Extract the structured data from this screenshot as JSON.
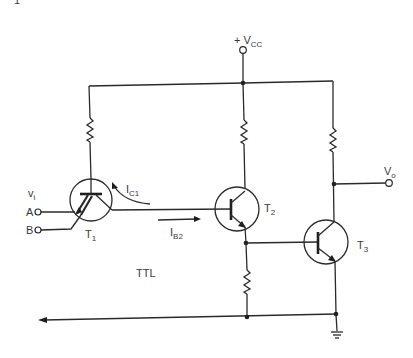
{
  "diagram": {
    "title": "TTL",
    "supply": {
      "label": "+ V",
      "subscript": "CC"
    },
    "output": {
      "label": "V",
      "subscript": "o"
    },
    "input": {
      "label": "v",
      "subscript": "i",
      "pins": [
        "A",
        "B"
      ]
    },
    "transistors": [
      {
        "label": "T",
        "subscript": "1",
        "type": "multi-emitter npn"
      },
      {
        "label": "T",
        "subscript": "2",
        "type": "npn"
      },
      {
        "label": "T",
        "subscript": "3",
        "type": "npn"
      }
    ],
    "currents": [
      {
        "label": "I",
        "subscript": "C1"
      },
      {
        "label": "I",
        "subscript": "B2"
      }
    ],
    "corner_glyph": "1"
  }
}
